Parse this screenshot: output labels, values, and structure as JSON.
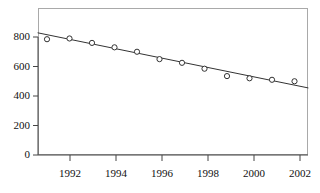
{
  "chart_data": {
    "type": "scatter",
    "title": "",
    "subtitle": "",
    "xlabel": "",
    "ylabel": "",
    "x": [
      1991,
      1992,
      1993,
      1994,
      1995,
      1996,
      1997,
      1998,
      1999,
      2000,
      2001,
      2002
    ],
    "values": [
      785,
      790,
      760,
      730,
      700,
      650,
      625,
      585,
      535,
      520,
      510,
      500
    ],
    "series": [
      {
        "name": "observed",
        "marker": "open-circle",
        "values": [
          785,
          790,
          760,
          730,
          700,
          650,
          625,
          585,
          535,
          520,
          510,
          500
        ]
      },
      {
        "name": "linear-fit",
        "type": "line",
        "x_endpoints": [
          1990.6,
          2002.6
        ],
        "y_endpoints": [
          828,
          455
        ]
      }
    ],
    "xlim": [
      1990.6,
      2002.6
    ],
    "ylim": [
      0,
      890
    ],
    "xticks": [
      1992,
      1994,
      1996,
      1998,
      2000,
      2002
    ],
    "xtick_labels": [
      "1992",
      "1994",
      "1996",
      "1998",
      "2000",
      "2002"
    ],
    "yticks": [
      0,
      200,
      400,
      600,
      800
    ],
    "ytick_labels": [
      "0",
      "200",
      "400",
      "600",
      "800"
    ],
    "grid": false,
    "legend": "none",
    "colors": {
      "marker_stroke": "#333333",
      "marker_fill": "#ffffff",
      "fit_line": "#333333",
      "frame": "#a9a9a9",
      "axis": "#444444",
      "background": "#ffffff"
    }
  }
}
